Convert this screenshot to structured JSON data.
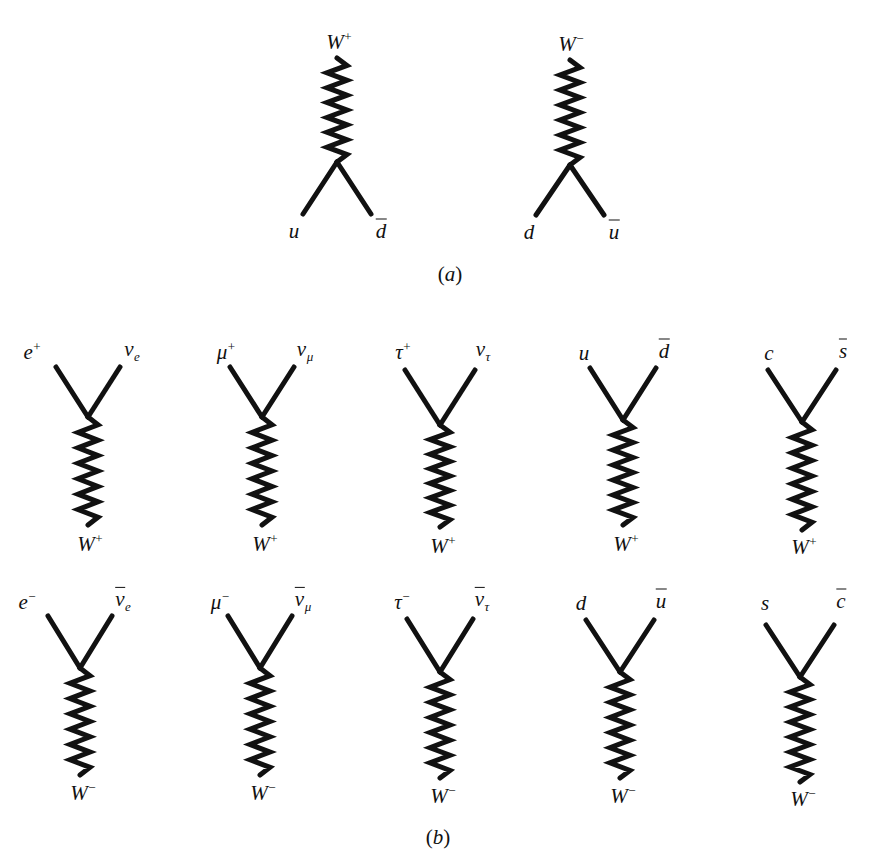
{
  "figure": {
    "width": 869,
    "height": 856,
    "background": "#ffffff",
    "ink_color": "#111111"
  },
  "panels": [
    {
      "id": "a",
      "caption": "(a)",
      "caption_x": 450,
      "caption_y": 274,
      "caption_font_size": 21,
      "diagrams": [
        {
          "name": "w-plus-to-u-dbar",
          "orientation": "boson-up",
          "vertex_x": 337,
          "vertex_y": 162,
          "wave_top_y": 58,
          "wave_amplitude": 10,
          "wave_cycles": 7,
          "leg_dx": 34,
          "leg_dy": 52,
          "boson_label": "W",
          "boson_sign": "+",
          "boson_label_x": 339,
          "boson_label_y": 41,
          "left_label": {
            "base": "u",
            "bar": false,
            "sup": "",
            "sub": "",
            "x": 294,
            "y": 231
          },
          "right_label": {
            "base": "d",
            "bar": true,
            "sup": "",
            "sub": "",
            "x": 381,
            "y": 231
          }
        },
        {
          "name": "w-minus-to-d-ubar",
          "orientation": "boson-up",
          "vertex_x": 570,
          "vertex_y": 165,
          "wave_top_y": 60,
          "wave_amplitude": 10,
          "wave_cycles": 7,
          "leg_dx": 34,
          "leg_dy": 50,
          "boson_label": "W",
          "boson_sign": "−",
          "boson_label_x": 571,
          "boson_label_y": 43,
          "left_label": {
            "base": "d",
            "bar": false,
            "sup": "",
            "sub": "",
            "x": 529,
            "y": 232
          },
          "right_label": {
            "base": "u",
            "bar": true,
            "sup": "",
            "sub": "",
            "x": 614,
            "y": 232
          }
        }
      ]
    },
    {
      "id": "b",
      "caption": "(b)",
      "caption_x": 438,
      "caption_y": 837,
      "caption_font_size": 21,
      "diagrams": [
        {
          "name": "w-plus-to-positron-nu-e",
          "orientation": "boson-down",
          "vertex_x": 88,
          "vertex_y": 417,
          "wave_bottom_y": 525,
          "wave_amplitude": 10,
          "wave_cycles": 7,
          "leg_dx": 32,
          "leg_dy": 50,
          "boson_label": "W",
          "boson_sign": "+",
          "boson_label_x": 90,
          "boson_label_y": 543,
          "left_label": {
            "base": "e",
            "bar": false,
            "sup": "+",
            "sub": "",
            "x": 32,
            "y": 351
          },
          "right_label": {
            "base": "ν",
            "bar": false,
            "sup": "",
            "sub": "e",
            "x": 132,
            "y": 351
          }
        },
        {
          "name": "w-plus-to-antimuon-nu-mu",
          "orientation": "boson-down",
          "vertex_x": 262,
          "vertex_y": 417,
          "wave_bottom_y": 525,
          "wave_amplitude": 10,
          "wave_cycles": 7,
          "leg_dx": 32,
          "leg_dy": 50,
          "boson_label": "W",
          "boson_sign": "+",
          "boson_label_x": 265,
          "boson_label_y": 543,
          "left_label": {
            "base": "μ",
            "bar": false,
            "sup": "+",
            "sub": "",
            "x": 226,
            "y": 351
          },
          "right_label": {
            "base": "ν",
            "bar": false,
            "sup": "",
            "sub": "μ",
            "x": 305,
            "y": 351
          }
        },
        {
          "name": "w-plus-to-antitau-nu-tau",
          "orientation": "boson-down",
          "vertex_x": 440,
          "vertex_y": 425,
          "wave_bottom_y": 527,
          "wave_amplitude": 10,
          "wave_cycles": 7,
          "leg_dx": 35,
          "leg_dy": 55,
          "boson_label": "W",
          "boson_sign": "+",
          "boson_label_x": 443,
          "boson_label_y": 545,
          "left_label": {
            "base": "τ",
            "bar": false,
            "sup": "+",
            "sub": "",
            "x": 403,
            "y": 351
          },
          "right_label": {
            "base": "ν",
            "bar": false,
            "sup": "",
            "sub": "τ",
            "x": 483,
            "y": 351
          }
        },
        {
          "name": "w-plus-to-u-dbar-b",
          "orientation": "boson-down",
          "vertex_x": 623,
          "vertex_y": 420,
          "wave_bottom_y": 525,
          "wave_amplitude": 10,
          "wave_cycles": 7,
          "leg_dx": 33,
          "leg_dy": 52,
          "boson_label": "W",
          "boson_sign": "+",
          "boson_label_x": 626,
          "boson_label_y": 543,
          "left_label": {
            "base": "u",
            "bar": false,
            "sup": "",
            "sub": "",
            "x": 584,
            "y": 353
          },
          "right_label": {
            "base": "d",
            "bar": true,
            "sup": "",
            "sub": "",
            "x": 664,
            "y": 351
          }
        },
        {
          "name": "w-plus-to-c-sbar",
          "orientation": "boson-down",
          "vertex_x": 802,
          "vertex_y": 422,
          "wave_bottom_y": 530,
          "wave_amplitude": 10,
          "wave_cycles": 7,
          "leg_dx": 34,
          "leg_dy": 52,
          "boson_label": "W",
          "boson_sign": "+",
          "boson_label_x": 804,
          "boson_label_y": 546,
          "left_label": {
            "base": "c",
            "bar": false,
            "sup": "",
            "sub": "",
            "x": 769,
            "y": 353
          },
          "right_label": {
            "base": "s",
            "bar": true,
            "sup": "",
            "sub": "",
            "x": 843,
            "y": 351
          }
        },
        {
          "name": "w-minus-to-electron-antinu-e",
          "orientation": "boson-down",
          "vertex_x": 80,
          "vertex_y": 668,
          "wave_bottom_y": 775,
          "wave_amplitude": 10,
          "wave_cycles": 7,
          "leg_dx": 32,
          "leg_dy": 52,
          "boson_label": "W",
          "boson_sign": "−",
          "boson_label_x": 83,
          "boson_label_y": 792,
          "left_label": {
            "base": "e",
            "bar": false,
            "sup": "−",
            "sub": "",
            "x": 27,
            "y": 601
          },
          "right_label": {
            "base": "ν",
            "bar": true,
            "sup": "",
            "sub": "e",
            "x": 123,
            "y": 601
          }
        },
        {
          "name": "w-minus-to-muon-antinu-mu",
          "orientation": "boson-down",
          "vertex_x": 260,
          "vertex_y": 668,
          "wave_bottom_y": 775,
          "wave_amplitude": 10,
          "wave_cycles": 7,
          "leg_dx": 32,
          "leg_dy": 52,
          "boson_label": "W",
          "boson_sign": "−",
          "boson_label_x": 263,
          "boson_label_y": 792,
          "left_label": {
            "base": "μ",
            "bar": false,
            "sup": "−",
            "sub": "",
            "x": 220,
            "y": 601
          },
          "right_label": {
            "base": "ν",
            "bar": true,
            "sup": "",
            "sub": "μ",
            "x": 303,
            "y": 601
          }
        },
        {
          "name": "w-minus-to-tau-antinu-tau",
          "orientation": "boson-down",
          "vertex_x": 440,
          "vertex_y": 672,
          "wave_bottom_y": 778,
          "wave_amplitude": 10,
          "wave_cycles": 7,
          "leg_dx": 33,
          "leg_dy": 53,
          "boson_label": "W",
          "boson_sign": "−",
          "boson_label_x": 443,
          "boson_label_y": 795,
          "left_label": {
            "base": "τ",
            "bar": false,
            "sup": "−",
            "sub": "",
            "x": 402,
            "y": 601
          },
          "right_label": {
            "base": "ν",
            "bar": true,
            "sup": "",
            "sub": "τ",
            "x": 482,
            "y": 601
          }
        },
        {
          "name": "w-minus-to-d-ubar-b",
          "orientation": "boson-down",
          "vertex_x": 620,
          "vertex_y": 672,
          "wave_bottom_y": 778,
          "wave_amplitude": 10,
          "wave_cycles": 7,
          "leg_dx": 34,
          "leg_dy": 52,
          "boson_label": "W",
          "boson_sign": "−",
          "boson_label_x": 623,
          "boson_label_y": 795,
          "left_label": {
            "base": "d",
            "bar": false,
            "sup": "",
            "sub": "",
            "x": 581,
            "y": 603
          },
          "right_label": {
            "base": "u",
            "bar": true,
            "sup": "",
            "sub": "",
            "x": 661,
            "y": 601
          }
        },
        {
          "name": "w-minus-to-s-cbar",
          "orientation": "boson-down",
          "vertex_x": 800,
          "vertex_y": 677,
          "wave_bottom_y": 782,
          "wave_amplitude": 10,
          "wave_cycles": 7,
          "leg_dx": 34,
          "leg_dy": 52,
          "boson_label": "W",
          "boson_sign": "−",
          "boson_label_x": 803,
          "boson_label_y": 798,
          "left_label": {
            "base": "s",
            "bar": false,
            "sup": "",
            "sub": "",
            "x": 765,
            "y": 603
          },
          "right_label": {
            "base": "c",
            "bar": true,
            "sup": "",
            "sub": "",
            "x": 841,
            "y": 601
          }
        }
      ]
    }
  ],
  "style": {
    "line_width": 5,
    "label_font_size": 21,
    "boson_label_font_size": 21
  }
}
